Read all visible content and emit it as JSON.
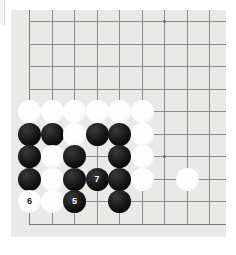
{
  "app": {
    "title": "Go Board Diagram",
    "view_label": "Go board corner position"
  },
  "board": {
    "type": "go-board-corner",
    "size": 19,
    "visible_columns": 9,
    "visible_rows": 10,
    "background_color": "#e9e9e7",
    "line_color": "#8c8c8c",
    "grid_spacing_px": 22.5,
    "star_point_label": "hoshi",
    "star_points": [
      {
        "col": 7,
        "row": 1
      },
      {
        "col": 7,
        "row": 7
      }
    ]
  },
  "stones": [
    {
      "id": "w-c1r5",
      "color": "white",
      "col": 1,
      "row": 5,
      "label": ""
    },
    {
      "id": "w-c2r5",
      "color": "white",
      "col": 2,
      "row": 5,
      "label": ""
    },
    {
      "id": "w-c3r5",
      "color": "white",
      "col": 3,
      "row": 5,
      "label": ""
    },
    {
      "id": "w-c4r5",
      "color": "white",
      "col": 4,
      "row": 5,
      "label": ""
    },
    {
      "id": "w-c5r5",
      "color": "white",
      "col": 5,
      "row": 5,
      "label": ""
    },
    {
      "id": "w-c6r5",
      "color": "white",
      "col": 6,
      "row": 5,
      "label": ""
    },
    {
      "id": "b-c1r6",
      "color": "black",
      "col": 1,
      "row": 6,
      "label": ""
    },
    {
      "id": "b-c2r6",
      "color": "black",
      "col": 2,
      "row": 6,
      "label": ""
    },
    {
      "id": "w-c3r6",
      "color": "white",
      "col": 3,
      "row": 6,
      "label": ""
    },
    {
      "id": "b-c4r6",
      "color": "black",
      "col": 4,
      "row": 6,
      "label": ""
    },
    {
      "id": "b-c5r6",
      "color": "black",
      "col": 5,
      "row": 6,
      "label": ""
    },
    {
      "id": "w-c6r6",
      "color": "white",
      "col": 6,
      "row": 6,
      "label": ""
    },
    {
      "id": "b-c1r7",
      "color": "black",
      "col": 1,
      "row": 7,
      "label": ""
    },
    {
      "id": "w-c2r7",
      "color": "white",
      "col": 2,
      "row": 7,
      "label": ""
    },
    {
      "id": "b-c3r7",
      "color": "black",
      "col": 3,
      "row": 7,
      "label": ""
    },
    {
      "id": "b-c5r7",
      "color": "black",
      "col": 5,
      "row": 7,
      "label": ""
    },
    {
      "id": "w-c6r7",
      "color": "white",
      "col": 6,
      "row": 7,
      "label": ""
    },
    {
      "id": "b-c1r8",
      "color": "black",
      "col": 1,
      "row": 8,
      "label": ""
    },
    {
      "id": "w-c2r8",
      "color": "white",
      "col": 2,
      "row": 8,
      "label": ""
    },
    {
      "id": "b-c3r8",
      "color": "black",
      "col": 3,
      "row": 8,
      "label": ""
    },
    {
      "id": "b-c4r8",
      "color": "black",
      "col": 4,
      "row": 8,
      "label": "7"
    },
    {
      "id": "b-c5r8",
      "color": "black",
      "col": 5,
      "row": 8,
      "label": ""
    },
    {
      "id": "w-c6r8",
      "color": "white",
      "col": 6,
      "row": 8,
      "label": ""
    },
    {
      "id": "w-c8r8",
      "color": "white",
      "col": 8,
      "row": 8,
      "label": ""
    },
    {
      "id": "w-c1r9",
      "color": "white",
      "col": 1,
      "row": 9,
      "label": "6"
    },
    {
      "id": "w-c2r9",
      "color": "white",
      "col": 2,
      "row": 9,
      "label": ""
    },
    {
      "id": "b-c3r9",
      "color": "black",
      "col": 3,
      "row": 9,
      "label": "5"
    },
    {
      "id": "b-c5r9",
      "color": "black",
      "col": 5,
      "row": 9,
      "label": ""
    }
  ],
  "move_numbers": [
    {
      "number": "5",
      "color": "black"
    },
    {
      "number": "6",
      "color": "white"
    },
    {
      "number": "7",
      "color": "black"
    }
  ]
}
